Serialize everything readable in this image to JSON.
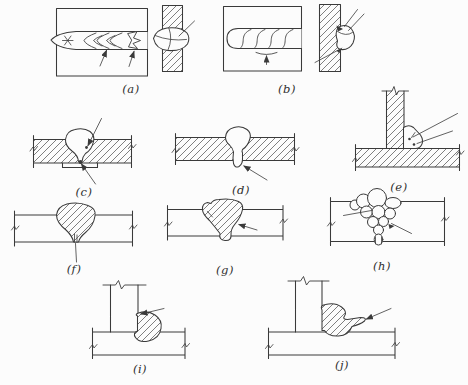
{
  "page": {
    "background_color": "#fcfcfc",
    "ink_color": "#3a3a3a"
  },
  "figure_labels": {
    "a": "(a)",
    "b": "(b)",
    "c": "(c)",
    "d": "(d)",
    "e": "(e)",
    "f": "(f)",
    "g": "(g)",
    "h": "(h)",
    "i": "(i)",
    "j": "(j)"
  }
}
